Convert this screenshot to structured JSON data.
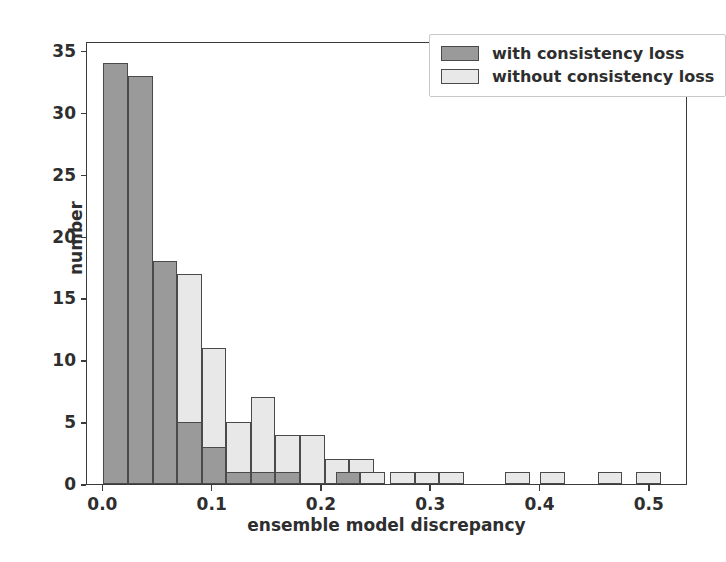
{
  "chart_data": {
    "type": "bar",
    "title": "",
    "subtitle": "",
    "xlabel": "ensemble model discrepancy",
    "ylabel": "number",
    "xlim": [
      -0.015,
      0.535
    ],
    "ylim": [
      0,
      35.8
    ],
    "xticks": [
      "0.0",
      "0.1",
      "0.2",
      "0.3",
      "0.4",
      "0.5"
    ],
    "xtick_values": [
      0.0,
      0.1,
      0.2,
      0.3,
      0.4,
      0.5
    ],
    "yticks": [
      "0",
      "5",
      "10",
      "15",
      "20",
      "25",
      "30",
      "35"
    ],
    "ytick_values": [
      0,
      5,
      10,
      15,
      20,
      25,
      30,
      35
    ],
    "grid": false,
    "legend_position": "upper right",
    "bin_width": 0.0225,
    "series": [
      {
        "name": "with consistency loss",
        "color": "#9a9a9a",
        "edge_color": "#4a4a4a",
        "bins": [
          0.0,
          0.0225,
          0.045,
          0.0675,
          0.09,
          0.1125,
          0.135,
          0.1575,
          0.18,
          0.2025,
          0.225
        ],
        "values": [
          34,
          33,
          18,
          5,
          3,
          1,
          1,
          1,
          0,
          1
        ]
      },
      {
        "name": "without consistency loss",
        "color": "#e8e8e8",
        "edge_color": "#4a4a4a",
        "bins": [
          0.0225,
          0.045,
          0.0675,
          0.09,
          0.1125,
          0.135,
          0.1575,
          0.18,
          0.2025,
          0.225,
          0.2475,
          0.27,
          0.2925,
          0.315,
          0.3375,
          0.36,
          0.3825,
          0.405,
          0.4275,
          0.45,
          0.4725,
          0.495
        ],
        "values": [
          11,
          12,
          17,
          11,
          5,
          7,
          4,
          4,
          2,
          2,
          1,
          1,
          1,
          1,
          0,
          1,
          1,
          0,
          0,
          1,
          0,
          1
        ]
      }
    ],
    "bars_with": [
      {
        "x0": 0.0,
        "x1": 0.0225,
        "value": 34
      },
      {
        "x0": 0.0225,
        "x1": 0.045,
        "value": 33
      },
      {
        "x0": 0.045,
        "x1": 0.0675,
        "value": 18
      },
      {
        "x0": 0.0675,
        "x1": 0.09,
        "value": 5
      },
      {
        "x0": 0.09,
        "x1": 0.1125,
        "value": 3
      },
      {
        "x0": 0.1125,
        "x1": 0.135,
        "value": 1
      },
      {
        "x0": 0.135,
        "x1": 0.1575,
        "value": 1
      },
      {
        "x0": 0.1575,
        "x1": 0.18,
        "value": 1
      },
      {
        "x0": 0.2125,
        "x1": 0.235,
        "value": 1
      }
    ],
    "bars_without": [
      {
        "x0": 0.0225,
        "x1": 0.045,
        "value": 11
      },
      {
        "x0": 0.045,
        "x1": 0.0675,
        "value": 12
      },
      {
        "x0": 0.0675,
        "x1": 0.09,
        "value": 17
      },
      {
        "x0": 0.09,
        "x1": 0.1125,
        "value": 11
      },
      {
        "x0": 0.1125,
        "x1": 0.135,
        "value": 5
      },
      {
        "x0": 0.135,
        "x1": 0.1575,
        "value": 7
      },
      {
        "x0": 0.1575,
        "x1": 0.18,
        "value": 4
      },
      {
        "x0": 0.18,
        "x1": 0.2025,
        "value": 4
      },
      {
        "x0": 0.2025,
        "x1": 0.225,
        "value": 2
      },
      {
        "x0": 0.225,
        "x1": 0.2475,
        "value": 2
      },
      {
        "x0": 0.235,
        "x1": 0.2575,
        "value": 1
      },
      {
        "x0": 0.2625,
        "x1": 0.285,
        "value": 1
      },
      {
        "x0": 0.285,
        "x1": 0.3075,
        "value": 1
      },
      {
        "x0": 0.3075,
        "x1": 0.33,
        "value": 1
      },
      {
        "x0": 0.3675,
        "x1": 0.39,
        "value": 1
      },
      {
        "x0": 0.4,
        "x1": 0.4225,
        "value": 1
      },
      {
        "x0": 0.4525,
        "x1": 0.475,
        "value": 1
      },
      {
        "x0": 0.4875,
        "x1": 0.51,
        "value": 1
      }
    ]
  },
  "legend": {
    "entries": [
      {
        "label": "with consistency loss",
        "color": "#9a9a9a"
      },
      {
        "label": "without consistency loss",
        "color": "#e8e8e8"
      }
    ]
  },
  "axes": {
    "x_title": "ensemble model discrepancy",
    "y_title": "number"
  }
}
